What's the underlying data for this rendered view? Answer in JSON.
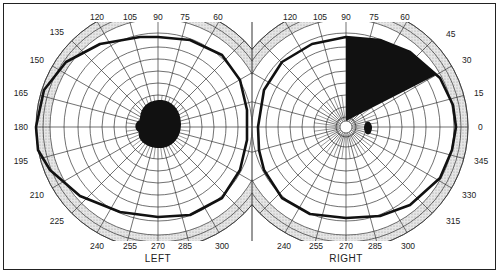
{
  "figure": {
    "eyes": [
      {
        "id": "left",
        "label": "LEFT",
        "center": [
          158,
          127
        ],
        "angle_labels_top": [
          "120",
          "105",
          "90",
          "75",
          "60"
        ],
        "angle_labels_left": [
          "135",
          "150",
          "165",
          "180",
          "195",
          "210",
          "225"
        ],
        "angle_labels_bottom": [
          "240",
          "255",
          "270",
          "285",
          "300"
        ],
        "findings": [
          {
            "type": "central-scotoma",
            "shape": "blob",
            "fill": "#111111"
          }
        ]
      },
      {
        "id": "right",
        "label": "RIGHT",
        "center": [
          346,
          127
        ],
        "angle_labels_top": [
          "120",
          "105",
          "90",
          "75",
          "60",
          "45"
        ],
        "angle_labels_right": [
          "30",
          "15",
          "0",
          "345",
          "330",
          "315"
        ],
        "angle_labels_bottom": [
          "240",
          "255",
          "270",
          "285",
          "300"
        ],
        "findings": [
          {
            "type": "sector-defect",
            "from_deg": 30,
            "to_deg": 90,
            "fill": "#111111"
          },
          {
            "type": "blind-spot",
            "shape": "ellipse",
            "fill": "#111111"
          }
        ]
      }
    ],
    "colors": {
      "grid": "#333333",
      "isopter": "#111111",
      "periphery_shade": "#d8d8d8",
      "background": "#ffffff"
    }
  }
}
